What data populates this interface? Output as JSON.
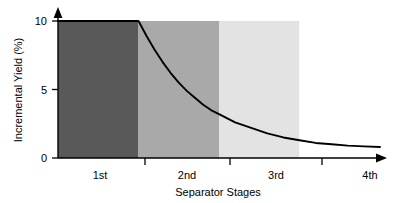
{
  "chart_data": {
    "type": "area",
    "title": "",
    "subtitle": "",
    "xlabel": "Separator Stages",
    "ylabel": "Incremental Yield (%)",
    "xlim": [
      0,
      4
    ],
    "ylim": [
      0,
      10
    ],
    "grid": false,
    "legend": "none",
    "categories": [
      "1st",
      "2nd",
      "3rd",
      "4th"
    ],
    "x_tick_labels": [
      "1st",
      "2nd",
      "3rd",
      "4th"
    ],
    "y_tick_labels": [
      "0",
      "5",
      "10"
    ],
    "y_ticks": [
      0,
      5,
      10
    ],
    "x_axis_arrow": true,
    "y_axis_arrow": true,
    "bands": [
      {
        "name": "1st",
        "label": "1st",
        "from": 0,
        "to": 1,
        "color": "#595959",
        "value": 10
      },
      {
        "name": "2nd",
        "label": "2nd",
        "from": 1,
        "to": 2,
        "color": "#a9a9a9",
        "value": 3.2
      },
      {
        "name": "3rd",
        "label": "3rd",
        "from": 2,
        "to": 3,
        "color": "#e3e3e3",
        "value": 1.3
      },
      {
        "name": "4th",
        "label": "4th",
        "from": 3,
        "to": 4,
        "color": "#ffffff",
        "value": 0.8
      }
    ],
    "series": [
      {
        "name": "Incremental Yield",
        "color": "#000000",
        "x": [
          0,
          0.2,
          0.4,
          0.6,
          0.8,
          1,
          1.1,
          1.2,
          1.3,
          1.4,
          1.5,
          1.6,
          1.7,
          1.8,
          1.9,
          2,
          2.2,
          2.4,
          2.6,
          2.8,
          3,
          3.2,
          3.4,
          3.6,
          3.8,
          4
        ],
        "values": [
          10,
          10,
          10,
          10,
          10,
          10,
          8.9,
          7.9,
          7.0,
          6.2,
          5.5,
          4.9,
          4.4,
          3.9,
          3.5,
          3.2,
          2.6,
          2.2,
          1.8,
          1.5,
          1.3,
          1.1,
          1.0,
          0.9,
          0.85,
          0.8
        ]
      }
    ],
    "annotations": []
  },
  "axes": {
    "y_title": "Incremental Yield (%)",
    "x_title": "Separator Stages",
    "y_tick_0": "0",
    "y_tick_5": "5",
    "y_tick_10": "10",
    "x_tick_1": "1st",
    "x_tick_2": "2nd",
    "x_tick_3": "3rd",
    "x_tick_4": "4th"
  },
  "colors": {
    "band_1": "#595959",
    "band_2": "#a9a9a9",
    "band_3": "#e3e3e3",
    "band_4": "#ffffff",
    "curve": "#000000",
    "axis": "#000000",
    "background": "#ffffff"
  }
}
